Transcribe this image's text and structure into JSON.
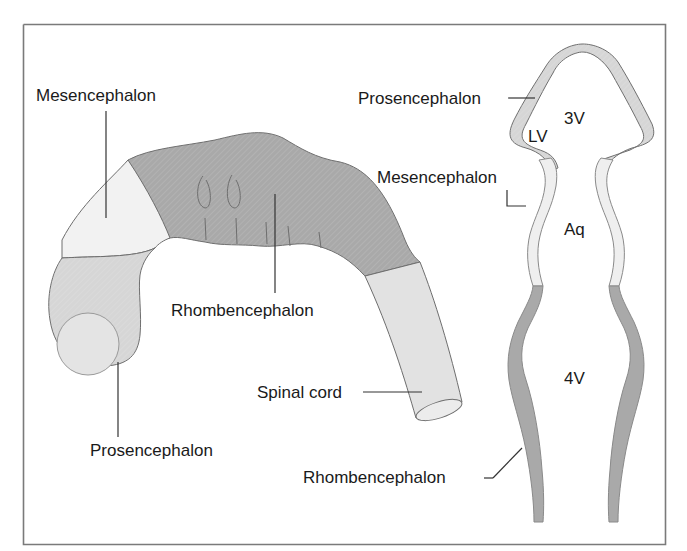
{
  "figure": {
    "left_panel": {
      "title": "Lateral view of embryonic neural tube",
      "labels": {
        "mesencephalon": "Mesencephalon",
        "rhombencephalon": "Rhombencephalon",
        "prosencephalon": "Prosencephalon",
        "spinal_cord": "Spinal cord"
      }
    },
    "right_panel": {
      "title": "Longitudinal section of neural tube",
      "labels": {
        "prosencephalon": "Prosencephalon",
        "mesencephalon": "Mesencephalon",
        "rhombencephalon": "Rhombencephalon"
      },
      "cavities": {
        "third_ventricle": "3V",
        "lateral_ventricle": "LV",
        "aqueduct": "Aq",
        "fourth_ventricle": "4V"
      }
    },
    "colors": {
      "border": "#7a7a7a",
      "prosencephalon_fill": "#d6d6d6",
      "mesencephalon_fill": "#f0f0f0",
      "rhombencephalon_fill": "#a9a9a9",
      "spinal_cord_fill": "#e2e2e2",
      "outline": "#6e6e6e",
      "leader_line": "#333333"
    }
  }
}
